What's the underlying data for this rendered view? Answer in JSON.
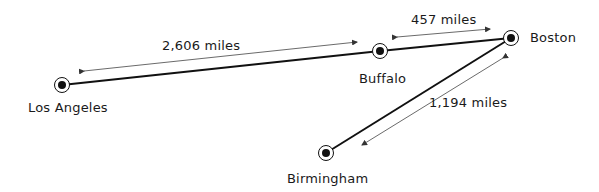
{
  "cities": [
    {
      "name": "Los Angeles",
      "x": 62,
      "y": 85
    },
    {
      "name": "Buffalo",
      "x": 380,
      "y": 51
    },
    {
      "name": "Boston",
      "x": 511,
      "y": 38
    },
    {
      "name": "Birmingham",
      "x": 326,
      "y": 153
    }
  ],
  "routes": [
    {
      "from": "Los Angeles",
      "to": "Boston",
      "via": "Buffalo"
    },
    {
      "from": "Boston",
      "to": "Birmingham"
    }
  ],
  "distances": [
    {
      "between": [
        "Los Angeles",
        "Buffalo"
      ],
      "label": "2,606 miles"
    },
    {
      "between": [
        "Buffalo",
        "Boston"
      ],
      "label": "457 miles"
    },
    {
      "between": [
        "Boston",
        "Birmingham"
      ],
      "label": "1,194 miles"
    }
  ],
  "colors": {
    "line": "#111111",
    "arrow": "#444444",
    "text": "#1a1a1a",
    "background": "#ffffff"
  }
}
